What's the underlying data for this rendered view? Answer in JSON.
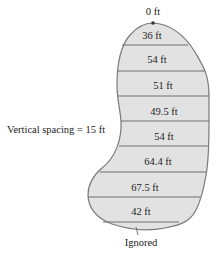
{
  "diagram": {
    "top_label": "0 ft",
    "widths": [
      {
        "label": "36 ft",
        "x": 152,
        "y": 39
      },
      {
        "label": "54 ft",
        "x": 157,
        "y": 63
      },
      {
        "label": "51 ft",
        "x": 163,
        "y": 89
      },
      {
        "label": "49.5 ft",
        "x": 164,
        "y": 115
      },
      {
        "label": "54 ft",
        "x": 164,
        "y": 140
      },
      {
        "label": "64.4 ft",
        "x": 158,
        "y": 165
      },
      {
        "label": "67.5 ft",
        "x": 145,
        "y": 191
      },
      {
        "label": "42 ft",
        "x": 141,
        "y": 215
      }
    ],
    "spacing_label": "Vertical spacing = 15 ft",
    "bottom_label": "Ignored",
    "fill_color": "#e2e2e2",
    "stroke_color": "#7a7a7a"
  }
}
